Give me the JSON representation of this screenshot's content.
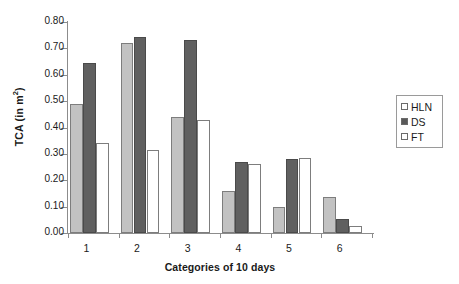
{
  "chart_data": {
    "type": "bar",
    "title": "",
    "subtitle": "",
    "xlabel": "Categories of 10 days",
    "ylabel": "TCA (in m²)",
    "ylabel_main": "TCA (in m",
    "ylabel_sup": "2",
    "ylabel_tail": ")",
    "categories": [
      "1",
      "2",
      "3",
      "4",
      "5",
      "6"
    ],
    "series": [
      {
        "name": "HLN",
        "color": "#c2c2c2",
        "values": [
          0.49,
          0.72,
          0.44,
          0.16,
          0.1,
          0.135
        ]
      },
      {
        "name": "DS",
        "color": "#606060",
        "values": [
          0.645,
          0.745,
          0.73,
          0.27,
          0.28,
          0.055
        ]
      },
      {
        "name": "FT",
        "color": "#ffffff",
        "values": [
          0.34,
          0.315,
          0.43,
          0.26,
          0.285,
          0.025
        ]
      }
    ],
    "ylim": [
      0.0,
      0.8
    ],
    "ytick_step": 0.1,
    "ytick_labels": [
      "0.00",
      "0.10",
      "0.20",
      "0.30",
      "0.40",
      "0.50",
      "0.60",
      "0.70",
      "0.80"
    ],
    "ytick_values": [
      0.0,
      0.1,
      0.2,
      0.3,
      0.4,
      0.5,
      0.6,
      0.7,
      0.8
    ],
    "grid": false,
    "legend_position": "right"
  },
  "legend": {
    "entries": [
      {
        "label": "HLN",
        "swatch": "hln"
      },
      {
        "label": "DS",
        "swatch": "ds"
      },
      {
        "label": "FT",
        "swatch": "ft"
      }
    ]
  },
  "colors": {
    "hln": "#c2c2c2",
    "ds": "#606060",
    "ft": "#ffffff",
    "axis": "#8c8c8c",
    "text": "#1a1a1a"
  }
}
